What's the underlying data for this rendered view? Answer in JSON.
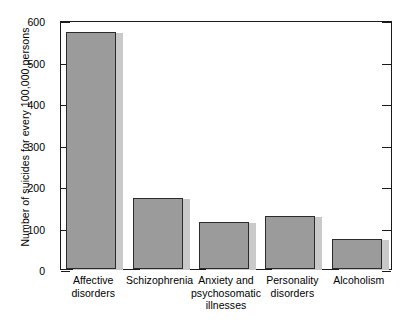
{
  "chart_data": {
    "type": "bar",
    "title": "",
    "xlabel": "",
    "ylabel": "Number of suicides for every 100,000 persons",
    "categories": [
      "Affective disorders",
      "Schizophrenia",
      "Anxiety and psychosomatic illnesses",
      "Personality disorders",
      "Alcoholism"
    ],
    "category_lines": [
      [
        "Affective",
        "disorders"
      ],
      [
        "Schizophrenia"
      ],
      [
        "Anxiety and",
        "psychosomatic",
        "illnesses"
      ],
      [
        "Personality",
        "disorders"
      ],
      [
        "Alcoholism"
      ]
    ],
    "values": [
      570,
      170,
      113,
      128,
      72
    ],
    "ylim": [
      0,
      600
    ],
    "yticks": [
      0,
      100,
      200,
      300,
      400,
      500,
      600
    ],
    "ytick_labels": [
      "0",
      "100",
      "200",
      "300",
      "400",
      "500",
      "600"
    ],
    "grid": false,
    "legend": null,
    "bar_color": "#9b9b9b",
    "bar_edge_color": "#2b2b2b",
    "bar_shadow_color": "#c9c9c9",
    "axis_color": "#1a1a1a",
    "background": "#ffffff"
  }
}
